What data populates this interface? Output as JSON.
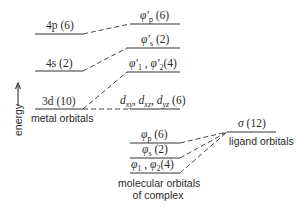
{
  "axis": {
    "label": "energy",
    "direction": "up"
  },
  "metal_orbitals": {
    "caption": "metal orbitals",
    "levels": [
      {
        "id": "4p",
        "orbital": "4p",
        "degeneracy": "(6)"
      },
      {
        "id": "4s",
        "orbital": "4s",
        "degeneracy": "(2)"
      },
      {
        "id": "3d",
        "orbital": "3d",
        "degeneracy": "(10)"
      }
    ]
  },
  "complex_upper": {
    "levels": [
      {
        "id": "phi-prime-p",
        "label": "φ′p (6)"
      },
      {
        "id": "phi-prime-s",
        "label": "φ′s (2)"
      },
      {
        "id": "phi-prime-12",
        "label": "φ′1 , φ′2 (4)"
      },
      {
        "id": "d-nonbonding",
        "label": "dxy, dxz, dyz (6)"
      }
    ]
  },
  "complex_lower": {
    "caption_line1": "molecular orbitals",
    "caption_line2": "of complex",
    "levels": [
      {
        "id": "phi-p",
        "label": "φp (6)"
      },
      {
        "id": "phi-s",
        "label": "φs (2)"
      },
      {
        "id": "phi-12",
        "label": "φ1 , φ2 (4)"
      }
    ]
  },
  "ligand_orbitals": {
    "caption": "ligand orbitals",
    "level": {
      "id": "sigma",
      "label": "σ (12)"
    }
  },
  "text": {
    "m4p_orb": "4p",
    "m4p_deg": "(6)",
    "m4s_orb": "4s",
    "m4s_deg": "(2)",
    "m3d_orb": "3d",
    "m3d_deg": "(10)",
    "phip_prime_sym": "φ′",
    "phip_prime_sub": "p",
    "phip_prime_deg": "(6)",
    "phis_prime_sym": "φ′",
    "phis_prime_sub": "s",
    "phis_prime_deg": "(2)",
    "phi1_prime_sym": "φ′",
    "phi1_prime_sub": "1",
    "sep": " , ",
    "phi2_prime_sym": "φ′",
    "phi2_prime_sub": "2",
    "phi12_prime_deg": "(4)",
    "dxy_d": "d",
    "dxy_sub": "xy",
    "dxz_d": "d",
    "dxz_sub": "xz",
    "dyz_d": "d",
    "dyz_sub": "yz",
    "comma": ", ",
    "dset_deg": "(6)",
    "phip_sym": "φ",
    "phip_sub": "p",
    "phip_deg": "(6)",
    "phis_sym": "φ",
    "phis_sub": "s",
    "phis_deg": "(2)",
    "phi1_sym": "φ",
    "phi1_sub": "1",
    "phi2_sym": "φ",
    "phi2_sub": "2",
    "phi12_deg": "(4)",
    "sigma_sym": "σ",
    "sigma_deg": "(12)"
  }
}
